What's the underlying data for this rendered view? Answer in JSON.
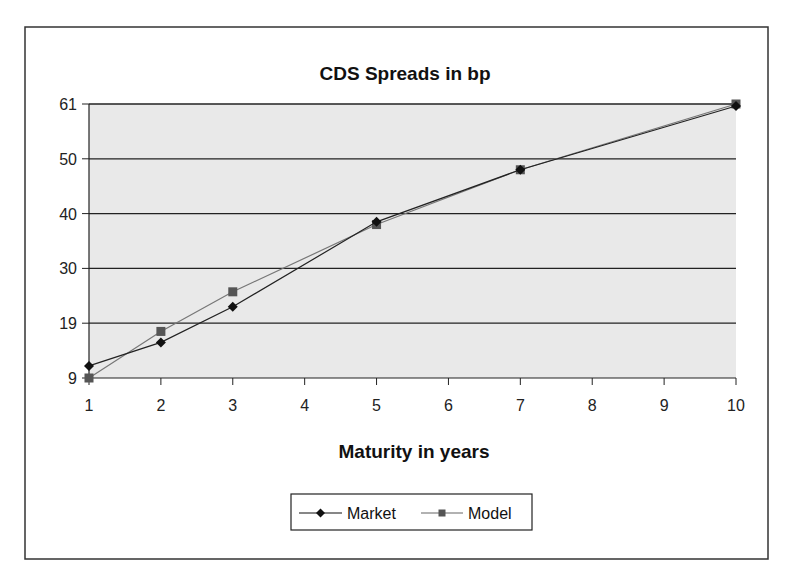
{
  "chart_data": {
    "type": "line",
    "title": "CDS Spreads in bp",
    "xlabel": "Maturity in years",
    "ylabel": "",
    "x_ticks": [
      1,
      2,
      3,
      4,
      5,
      6,
      7,
      8,
      9,
      10
    ],
    "y_ticks": [
      9,
      19,
      30,
      40,
      50,
      61
    ],
    "ylim": [
      9,
      61
    ],
    "xlim": [
      1,
      10
    ],
    "grid": true,
    "legend_position": "bottom",
    "series": [
      {
        "name": "Market",
        "marker": "diamond",
        "color": "#111111",
        "x": [
          1,
          2,
          3,
          5,
          7,
          10
        ],
        "values": [
          11.2,
          15.5,
          22.3,
          38.5,
          48.0,
          60.6
        ]
      },
      {
        "name": "Model",
        "marker": "square",
        "color": "#555555",
        "x": [
          1,
          2,
          3,
          5,
          7,
          10
        ],
        "values": [
          9.0,
          17.5,
          25.3,
          38.0,
          48.0,
          61.0
        ]
      }
    ]
  },
  "colors": {
    "plot_background": "#e9e9e9",
    "gridline": "#222222",
    "frame": "#333333"
  }
}
